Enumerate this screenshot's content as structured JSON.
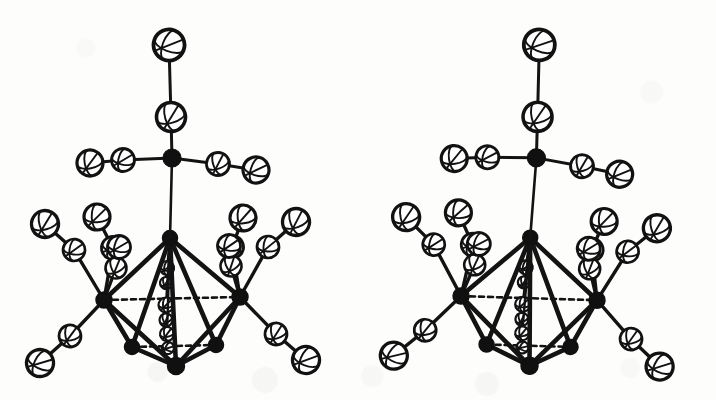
{
  "figure": {
    "kind": "ortep-stereo-pair",
    "background_color": "#fdfdfc",
    "ink_color": "#111111",
    "panel_count": 2,
    "panels": [
      {
        "name": "left-stereo-view",
        "offset_x": 0,
        "rotation_deg": 0.0
      },
      {
        "name": "right-stereo-view",
        "offset_x": 358,
        "rotation_deg": 3.0
      }
    ]
  },
  "style": {
    "ellipsoid_stroke": "#121212",
    "ellipsoid_fill": "#ffffff",
    "ellipsoid_stroke_width": 3.2,
    "octant_stroke_width": 1.9,
    "metal_fill": "#101010",
    "bond_stroke": "#131313",
    "bond_width_outer": 3.4,
    "bond_width_core": 4.6,
    "hidden_bond_dash": "5,4"
  },
  "molecule": {
    "description": "Octahedral metal cluster with terminal carbonyl ligands and an apical tripodal ligand",
    "metal_core": {
      "label": "M6 octahedron",
      "vertices": [
        {
          "name": "M-apex-top",
          "x": 170,
          "y": 238,
          "r": 7.5
        },
        {
          "name": "M-left",
          "x": 104,
          "y": 300,
          "r": 8.0
        },
        {
          "name": "M-right",
          "x": 240,
          "y": 297,
          "r": 8.0
        },
        {
          "name": "M-front-left",
          "x": 132,
          "y": 347,
          "r": 7.5
        },
        {
          "name": "M-front-right",
          "x": 216,
          "y": 345,
          "r": 7.5
        },
        {
          "name": "M-apex-bottom",
          "x": 176,
          "y": 366,
          "r": 8.5
        }
      ],
      "edges": [
        {
          "a": 0,
          "b": 1,
          "hidden": false
        },
        {
          "a": 0,
          "b": 2,
          "hidden": false
        },
        {
          "a": 0,
          "b": 3,
          "hidden": false
        },
        {
          "a": 0,
          "b": 4,
          "hidden": false
        },
        {
          "a": 0,
          "b": 5,
          "hidden": false
        },
        {
          "a": 1,
          "b": 3,
          "hidden": false
        },
        {
          "a": 1,
          "b": 5,
          "hidden": false
        },
        {
          "a": 2,
          "b": 4,
          "hidden": false
        },
        {
          "a": 2,
          "b": 5,
          "hidden": false
        },
        {
          "a": 3,
          "b": 5,
          "hidden": false
        },
        {
          "a": 4,
          "b": 5,
          "hidden": false
        },
        {
          "a": 3,
          "b": 4,
          "hidden": true
        },
        {
          "a": 1,
          "b": 2,
          "hidden": true
        }
      ]
    },
    "apical_group": {
      "label": "apical tripodal ligand",
      "stem": {
        "from_x": 170,
        "from_y": 238,
        "to_x": 172,
        "to_y": 158
      },
      "hub": {
        "name": "apical-hub-atom",
        "x": 172,
        "y": 158,
        "r": 9.0,
        "dark": true
      },
      "branches": [
        {
          "name": "apex-chain-up",
          "atoms": [
            {
              "x": 171,
              "y": 117,
              "r": 14.5
            },
            {
              "x": 169,
              "y": 45,
              "r": 15.5
            }
          ]
        },
        {
          "name": "apex-chain-left",
          "atoms": [
            {
              "x": 123,
              "y": 160,
              "r": 11.5
            },
            {
              "x": 90,
              "y": 163,
              "r": 13.0
            }
          ]
        },
        {
          "name": "apex-chain-right",
          "atoms": [
            {
              "x": 218,
              "y": 164,
              "r": 11.5
            },
            {
              "x": 256,
              "y": 170,
              "r": 13.0
            }
          ]
        }
      ]
    },
    "carbonyl_ligands": [
      {
        "name": "CO-left-up-outer",
        "metal": 1,
        "c": {
          "x": 74,
          "y": 250,
          "r": 11.0
        },
        "o": {
          "x": 45,
          "y": 224,
          "r": 13.5
        }
      },
      {
        "name": "CO-left-up-inner",
        "metal": 1,
        "c": {
          "x": 113,
          "y": 248,
          "r": 11.5
        },
        "o": {
          "x": 97,
          "y": 217,
          "r": 13.0
        }
      },
      {
        "name": "CO-left-vertical",
        "metal": 1,
        "c": {
          "x": 116,
          "y": 268,
          "r": 10.5
        },
        "o": {
          "x": 119,
          "y": 247,
          "r": 11.5
        }
      },
      {
        "name": "CO-left-down-outer",
        "metal": 1,
        "c": {
          "x": 70,
          "y": 336,
          "r": 11.0
        },
        "o": {
          "x": 40,
          "y": 363,
          "r": 13.5
        }
      },
      {
        "name": "CO-right-up-outer",
        "metal": 2,
        "c": {
          "x": 268,
          "y": 247,
          "r": 11.0
        },
        "o": {
          "x": 296,
          "y": 222,
          "r": 13.5
        }
      },
      {
        "name": "CO-right-up-inner",
        "metal": 2,
        "c": {
          "x": 232,
          "y": 247,
          "r": 11.5
        },
        "o": {
          "x": 243,
          "y": 218,
          "r": 13.0
        }
      },
      {
        "name": "CO-right-vertical",
        "metal": 2,
        "c": {
          "x": 231,
          "y": 266,
          "r": 10.5
        },
        "o": {
          "x": 229,
          "y": 246,
          "r": 11.5
        }
      },
      {
        "name": "CO-right-down-outer",
        "metal": 2,
        "c": {
          "x": 276,
          "y": 334,
          "r": 11.0
        },
        "o": {
          "x": 306,
          "y": 360,
          "r": 13.5
        }
      }
    ],
    "interior_ligands": [
      {
        "name": "CO-interior-upper",
        "atoms": [
          {
            "x": 167,
            "y": 268,
            "r": 7.0
          },
          {
            "x": 166,
            "y": 283,
            "r": 6.0
          }
        ]
      },
      {
        "name": "CO-interior-mid",
        "atoms": [
          {
            "x": 166,
            "y": 305,
            "r": 7.5
          },
          {
            "x": 166,
            "y": 320,
            "r": 6.5
          }
        ]
      },
      {
        "name": "CO-interior-lower",
        "atoms": [
          {
            "x": 167,
            "y": 334,
            "r": 7.0
          },
          {
            "x": 168,
            "y": 348,
            "r": 6.0
          }
        ]
      }
    ]
  }
}
